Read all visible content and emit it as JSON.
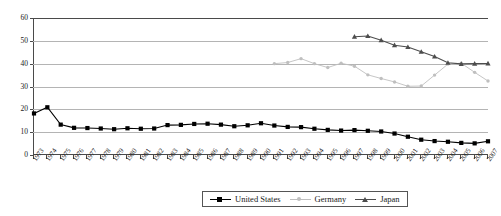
{
  "chart_data": {
    "type": "line",
    "title": "",
    "xlabel": "",
    "ylabel": "",
    "ylim": [
      0,
      60
    ],
    "ytick_values": [
      0,
      10,
      20,
      30,
      40,
      50,
      60
    ],
    "grid": "horizontal",
    "legend_position": "bottom-center",
    "x": [
      1973,
      1974,
      1975,
      1976,
      1977,
      1978,
      1979,
      1980,
      1981,
      1982,
      1983,
      1984,
      1985,
      1986,
      1987,
      1988,
      1989,
      1990,
      1991,
      1992,
      1993,
      1994,
      1995,
      1996,
      1997,
      1998,
      1999,
      2000,
      2001,
      2002,
      2003,
      2004,
      2005,
      2006,
      2007
    ],
    "xtick_labels": [
      "1973",
      "1974",
      "1975",
      "1976",
      "1977",
      "1978",
      "1979",
      "1980",
      "1981",
      "1982",
      "1983",
      "1984",
      "1985",
      "1986",
      "1987",
      "1988",
      "1989",
      "1990",
      "1991",
      "1992",
      "1993",
      "1994",
      "1995",
      "1996",
      "1997",
      "1998",
      "1999",
      "2000",
      "2001",
      "2002",
      "2003",
      "2004",
      "2005",
      "2006",
      "2007"
    ],
    "series": [
      {
        "name": "United States",
        "color": "#000000",
        "marker": "square",
        "x": [
          1973,
          1974,
          1975,
          1976,
          1977,
          1978,
          1979,
          1980,
          1981,
          1982,
          1983,
          1984,
          1985,
          1986,
          1987,
          1988,
          1989,
          1990,
          1991,
          1992,
          1993,
          1994,
          1995,
          1996,
          1997,
          1998,
          1999,
          2000,
          2001,
          2002,
          2003,
          2004,
          2005,
          2006,
          2007
        ],
        "values": [
          18.2,
          20.9,
          13.3,
          11.9,
          11.8,
          11.6,
          11.3,
          11.7,
          11.5,
          11.6,
          13.1,
          13.2,
          13.6,
          13.7,
          13.3,
          12.6,
          13.0,
          13.9,
          12.9,
          12.3,
          12.2,
          11.5,
          11.0,
          10.7,
          10.9,
          10.6,
          10.3,
          9.4,
          8.0,
          6.7,
          6.1,
          5.8,
          5.3,
          5.1,
          6.0
        ]
      },
      {
        "name": "Germany",
        "color": "#bfbfbf",
        "marker": "circle",
        "x": [
          1991,
          1992,
          1993,
          1994,
          1995,
          1996,
          1997,
          1998,
          1999,
          2000,
          2001,
          2002,
          2003,
          2004,
          2005,
          2006,
          2007
        ],
        "values": [
          40.0,
          40.5,
          42.2,
          40.0,
          38.3,
          40.2,
          38.9,
          35.1,
          33.5,
          32.0,
          30.1,
          30.2,
          35.0,
          39.8,
          40.2,
          36.2,
          32.4
        ]
      },
      {
        "name": "Japan",
        "color": "#4d4d4d",
        "marker": "triangle",
        "x": [
          1997,
          1998,
          1999,
          2000,
          2001,
          2002,
          2003,
          2004,
          2005,
          2006,
          2007
        ],
        "values": [
          51.8,
          52.1,
          50.3,
          48.1,
          47.3,
          45.2,
          43.1,
          40.4,
          39.9,
          40.0,
          40.1
        ]
      }
    ]
  },
  "legend": {
    "items": [
      {
        "label": "United States"
      },
      {
        "label": "Germany"
      },
      {
        "label": "Japan"
      }
    ]
  }
}
